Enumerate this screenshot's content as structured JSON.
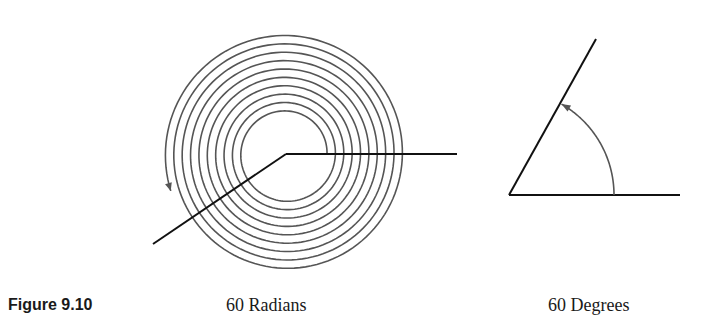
{
  "figure": {
    "number_label": "Figure 9.10",
    "panels": [
      {
        "id": "radians",
        "label": "60 Radians",
        "angle_value": 60,
        "unit": "radians",
        "depiction": "spiral-angle",
        "turns_approx": 9.55
      },
      {
        "id": "degrees",
        "label": "60 Degrees",
        "angle_value": 60,
        "unit": "degrees",
        "depiction": "simple-angle-with-arc"
      }
    ]
  },
  "colors": {
    "line": "#111111",
    "spiral": "#555555",
    "text": "#1a1a1a"
  }
}
